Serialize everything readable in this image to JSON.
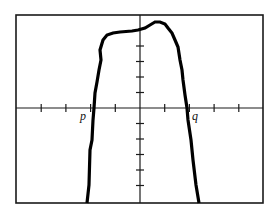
{
  "chart_data": {
    "type": "line",
    "title": "",
    "xlabel": "",
    "ylabel": "",
    "grid": false,
    "legend": null,
    "annotations": [
      {
        "text": "p",
        "meaning": "left x-intercept (zero of function)",
        "x_tick": -2
      },
      {
        "text": "q",
        "meaning": "right x-intercept (zero of function)",
        "x_tick": 2
      }
    ],
    "axes": {
      "x_ticks": [
        -4,
        -3,
        -2,
        -1,
        1,
        2,
        3,
        4
      ],
      "y_ticks_above": [
        1,
        2,
        3,
        4
      ],
      "y_ticks_below": [
        -1,
        -2,
        -3,
        -4,
        -5
      ],
      "x_tick_labels": [],
      "y_tick_labels": [],
      "xlim_ticks": [
        -5,
        5
      ],
      "ylim_ticks": [
        -6,
        6
      ]
    },
    "series": [
      {
        "name": "f(x)",
        "points_px": [
          [
            87,
            203
          ],
          [
            89,
            185
          ],
          [
            90,
            150
          ],
          [
            92,
            140
          ],
          [
            93,
            120
          ],
          [
            94,
            108
          ],
          [
            95,
            93
          ],
          [
            97,
            82
          ],
          [
            99,
            70
          ],
          [
            101,
            60
          ],
          [
            100,
            50
          ],
          [
            103,
            40
          ],
          [
            107,
            35
          ],
          [
            113,
            33
          ],
          [
            120,
            32
          ],
          [
            132,
            31
          ],
          [
            138,
            30
          ],
          [
            145,
            28
          ],
          [
            150,
            25
          ],
          [
            155,
            22
          ],
          [
            160,
            22
          ],
          [
            165,
            24
          ],
          [
            168,
            28
          ],
          [
            172,
            33
          ],
          [
            175,
            40
          ],
          [
            178,
            47
          ],
          [
            180,
            60
          ],
          [
            182,
            70
          ],
          [
            183,
            80
          ],
          [
            185,
            95
          ],
          [
            187,
            108
          ],
          [
            188,
            120
          ],
          [
            191,
            140
          ],
          [
            193,
            160
          ],
          [
            196,
            185
          ],
          [
            199,
            203
          ]
        ],
        "approx_values": {
          "x_units_per_tick": 1,
          "zeros": {
            "p": -1.85,
            "q": 1.9
          },
          "local_max": {
            "x": 0.8,
            "y": 5.6
          },
          "shoulder": {
            "x": -0.8,
            "y": 4.9
          }
        }
      }
    ]
  },
  "window": {
    "frame_px": {
      "left": 16,
      "top": 15,
      "right": 263,
      "bottom": 203
    },
    "origin_px": {
      "x": 140,
      "y": 108
    },
    "x_tick_spacing_px": 24.7,
    "y_tick_spacing_px": 15.5
  },
  "labels": {
    "p": "p",
    "q": "q"
  }
}
